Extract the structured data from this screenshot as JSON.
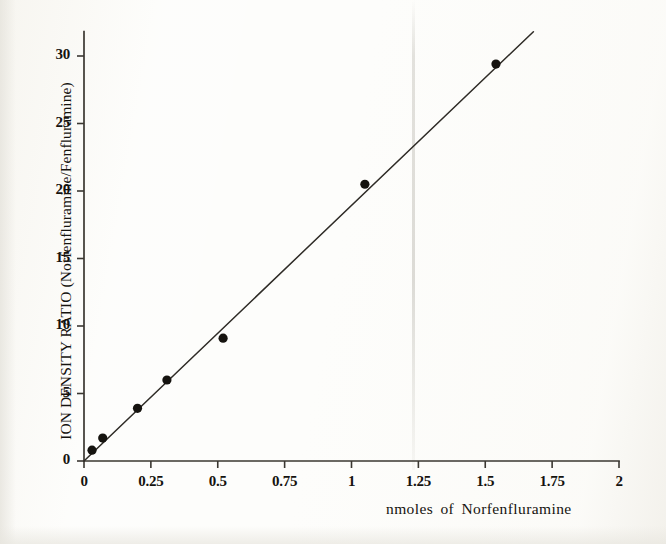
{
  "figure": {
    "background_color": "#fdfdfb",
    "ink_color": "#15130f",
    "axis_color": "#3a3731"
  },
  "chart_data": {
    "type": "scatter",
    "title": "",
    "subtitle": "",
    "xlabel": "nmoles of Norfenfluramine",
    "ylabel": "ION DENSITY RATIO (Norfenfluramine/Fenfluramine)",
    "xlim": [
      0,
      2
    ],
    "ylim": [
      0,
      31.8
    ],
    "grid": false,
    "legend": false,
    "legend_position": "none",
    "x_ticks": [
      0,
      0.25,
      0.5,
      0.75,
      1,
      1.25,
      1.5,
      1.75,
      2
    ],
    "x_tick_labels": [
      "0",
      "0.25",
      "0.5",
      "0.75",
      "1",
      "1.25",
      "1.5",
      "1.75",
      "2"
    ],
    "y_ticks": [
      0,
      5,
      10,
      15,
      20,
      25,
      30
    ],
    "y_tick_labels": [
      "0",
      "5",
      "10",
      "15",
      "20",
      "25",
      "30"
    ],
    "x": [
      0.03,
      0.07,
      0.2,
      0.31,
      0.52,
      1.05,
      1.54
    ],
    "y": [
      0.8,
      1.7,
      3.9,
      6.0,
      9.1,
      20.5,
      29.4
    ],
    "series": [
      {
        "name": "Norfenfluramine calibration",
        "marker": "filled-circle",
        "marker_color": "#15130f",
        "points": [
          {
            "x": 0.03,
            "y": 0.8
          },
          {
            "x": 0.07,
            "y": 1.7
          },
          {
            "x": 0.2,
            "y": 3.9
          },
          {
            "x": 0.31,
            "y": 6.0
          },
          {
            "x": 0.52,
            "y": 9.1
          },
          {
            "x": 1.05,
            "y": 20.5
          },
          {
            "x": 1.54,
            "y": 29.4
          }
        ]
      }
    ],
    "fit_line": {
      "name": "linear best fit",
      "color": "#2e2b26",
      "x_start": 0.0,
      "y_start": 0.0,
      "x_end": 1.68,
      "y_end": 31.8,
      "slope": 18.9,
      "intercept": 0.0
    },
    "annotations": []
  },
  "axis_labels": {
    "y_title": "ION DENSITY RATIO (Norfenfluramine/Fenfluramine)",
    "x_title": "nmoles of Norfenfluramine"
  }
}
